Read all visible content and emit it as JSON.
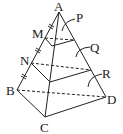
{
  "diagram": {
    "type": "geometry-pyramid",
    "colors": {
      "stroke": "#222222",
      "background": "#ffffff"
    },
    "vertices": {
      "A": {
        "label": "A",
        "x": 59,
        "y": 12
      },
      "B": {
        "label": "B",
        "x": 17,
        "y": 90
      },
      "C": {
        "label": "C",
        "x": 45,
        "y": 117
      },
      "D": {
        "label": "D",
        "x": 106,
        "y": 97
      },
      "M": {
        "label": "M",
        "x": 45,
        "y": 38
      },
      "N": {
        "label": "N",
        "x": 31,
        "y": 63
      }
    },
    "region_labels": {
      "P": {
        "label": "P"
      },
      "Q": {
        "label": "Q"
      },
      "R": {
        "label": "R"
      }
    },
    "tick_marks": "equal segments AM = MN = NB"
  }
}
